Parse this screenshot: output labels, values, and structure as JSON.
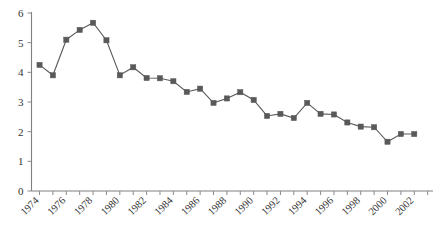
{
  "chart_data": {
    "type": "line",
    "title": "",
    "subtitle": "",
    "xlabel": "",
    "ylabel": "",
    "xlim": [
      1973.4,
      2003.4
    ],
    "ylim": [
      0,
      6
    ],
    "grid": false,
    "legend": null,
    "marker": "square",
    "series_color": "#595959",
    "axis_color": "#808080",
    "y_ticks": [
      0,
      1,
      2,
      3,
      4,
      5,
      6
    ],
    "y_tick_labels": [
      "0",
      "1",
      "2",
      "3",
      "4",
      "5",
      "6"
    ],
    "x_tick_labels": [
      "1974",
      "1976",
      "1978",
      "1980",
      "1982",
      "1984",
      "1986",
      "1988",
      "1990",
      "1992",
      "1994",
      "1996",
      "1998",
      "2000",
      "2002"
    ],
    "x_tick_label_years": [
      1974,
      1976,
      1978,
      1980,
      1982,
      1984,
      1986,
      1988,
      1990,
      1992,
      1994,
      1996,
      1998,
      2000,
      2002
    ],
    "x_minor_tick_years": [
      1974,
      1975,
      1976,
      1977,
      1978,
      1979,
      1980,
      1981,
      1982,
      1983,
      1984,
      1985,
      1986,
      1987,
      1988,
      1989,
      1990,
      1991,
      1992,
      1993,
      1994,
      1995,
      1996,
      1997,
      1998,
      1999,
      2000,
      2001,
      2002,
      2003
    ],
    "x_tick_label_rotation": -45,
    "x": [
      1974,
      1975,
      1976,
      1977,
      1978,
      1979,
      1980,
      1981,
      1982,
      1983,
      1984,
      1985,
      1986,
      1987,
      1988,
      1989,
      1990,
      1991,
      1992,
      1993,
      1994,
      1995,
      1996,
      1997,
      1998,
      1999,
      2000,
      2001,
      2002
    ],
    "values": [
      4.25,
      3.9,
      5.1,
      5.43,
      5.67,
      5.08,
      3.9,
      4.17,
      3.81,
      3.8,
      3.7,
      3.34,
      3.45,
      2.97,
      3.12,
      3.33,
      3.07,
      2.53,
      2.6,
      2.46,
      2.97,
      2.6,
      2.58,
      2.31,
      2.17,
      2.15,
      1.66,
      1.92,
      1.92
    ]
  }
}
